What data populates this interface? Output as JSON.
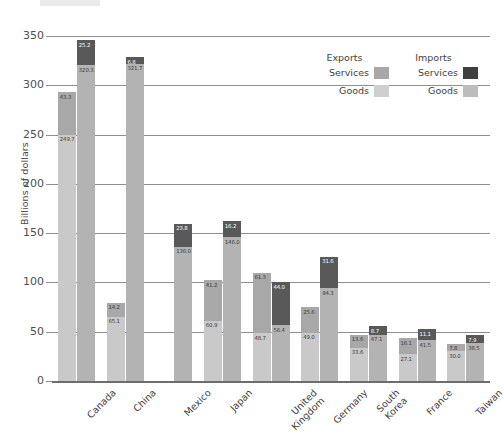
{
  "chart_data": {
    "type": "bar",
    "title": "",
    "subtitle": "",
    "xlabel": "",
    "ylabel": "Billions of dollars",
    "ylim": [
      0,
      350
    ],
    "yticks": [
      0,
      50,
      100,
      150,
      200,
      250,
      300,
      350
    ],
    "ytick_labels": [
      "0",
      "50",
      "100",
      "150",
      "200",
      "250",
      "300",
      "350"
    ],
    "grid": true,
    "stacked": true,
    "grouped": true,
    "legend_position": "top-right",
    "categories": [
      "Canada",
      "China",
      "Mexico",
      "Japan",
      "United Kingdom",
      "Germany",
      "South Korea",
      "France",
      "Taiwan"
    ],
    "series": [
      {
        "name": "Exports Goods",
        "group": "Exports",
        "part": "Goods",
        "color": "#c9c9c9",
        "values": [
          249.7,
          65.1,
          0.0,
          60.9,
          48.7,
          49.0,
          33.6,
          27.1,
          30.0
        ]
      },
      {
        "name": "Exports Services",
        "group": "Exports",
        "part": "Services",
        "color": "#a8a8a8",
        "values": [
          43.3,
          14.2,
          0.0,
          41.2,
          61.3,
          25.6,
          13.6,
          16.1,
          7.8
        ]
      },
      {
        "name": "Imports Goods",
        "group": "Imports",
        "part": "Goods",
        "color": "#b3b3b3",
        "values": [
          320.3,
          321.7,
          136.0,
          146.0,
          56.4,
          94.3,
          47.1,
          41.5,
          38.5
        ]
      },
      {
        "name": "Imports Services",
        "group": "Imports",
        "part": "Services",
        "color": "#595959",
        "values": [
          25.2,
          6.8,
          23.8,
          16.2,
          44.0,
          31.6,
          8.7,
          11.1,
          7.9
        ]
      }
    ],
    "bar_labels": {
      "Canada": {
        "exports_goods": "249.7",
        "exports_services": "43.3",
        "imports_goods": "320.3",
        "imports_services": "25.2"
      },
      "China": {
        "exports_goods": "65.1",
        "exports_services": "14.2",
        "imports_goods": "321.7",
        "imports_services": "6.8"
      },
      "Mexico": {
        "exports_goods": "",
        "exports_services": "",
        "imports_goods": "136.0",
        "imports_services": "23.8"
      },
      "Japan": {
        "exports_goods": "60.9",
        "exports_services": "41.2",
        "imports_goods": "146.0",
        "imports_services": "16.2"
      },
      "United Kingdom": {
        "exports_goods": "48.7",
        "exports_services": "61.3",
        "imports_goods": "56.4",
        "imports_services": "44.0"
      },
      "Germany": {
        "exports_goods": "49.0",
        "exports_services": "25.6",
        "imports_goods": "94.3",
        "imports_services": "31.6"
      },
      "South Korea": {
        "exports_goods": "33.6",
        "exports_services": "13.6",
        "imports_goods": "47.1",
        "imports_services": "8.7"
      },
      "France": {
        "exports_goods": "27.1",
        "exports_services": "16.1",
        "imports_goods": "41.5",
        "imports_services": "11.1"
      },
      "Taiwan": {
        "exports_goods": "30.0",
        "exports_services": "7.8",
        "imports_goods": "38.5",
        "imports_services": "7.9"
      }
    }
  },
  "legend": {
    "col1_header": "Exports",
    "col2_header": "Imports",
    "services_label_exports": "Services",
    "services_label_imports": "Services",
    "goods_label_exports": "Goods",
    "goods_label_imports": "Goods",
    "swatch_exports_services": "#a8a8a8",
    "swatch_imports_services": "#3f3f3f",
    "swatch_exports_goods": "#cfcfcf",
    "swatch_imports_goods": "#bcbcbc"
  },
  "axis": {
    "y_title": "Billions of dollars"
  }
}
